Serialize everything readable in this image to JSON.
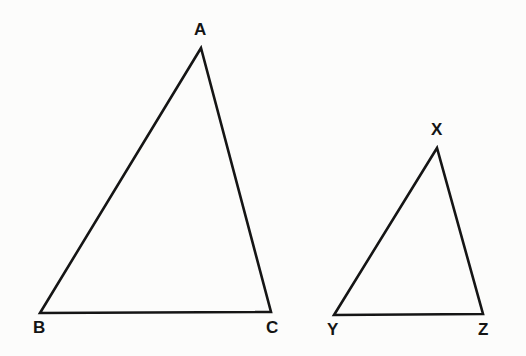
{
  "figure": {
    "kind": "geometry-diagram",
    "background_color": "#fcfcfb",
    "stroke_color": "#151515",
    "label_color": "#141414",
    "stroke_width": 2.6,
    "canvas": {
      "width": 526,
      "height": 356
    }
  },
  "shapes": [
    {
      "id": "triangle-abc",
      "name": "large-triangle",
      "type": "triangle",
      "vertices": [
        {
          "label": "A",
          "x": 201,
          "y": 48,
          "label_x": 194,
          "label_y": 21
        },
        {
          "label": "B",
          "x": 40,
          "y": 313,
          "label_x": 33,
          "label_y": 319
        },
        {
          "label": "C",
          "x": 271,
          "y": 312,
          "label_x": 266,
          "label_y": 319
        }
      ],
      "points": "201,48 40,313 271,312"
    },
    {
      "id": "triangle-xyz",
      "name": "small-triangle",
      "type": "triangle",
      "vertices": [
        {
          "label": "X",
          "x": 437,
          "y": 148,
          "label_x": 431,
          "label_y": 121
        },
        {
          "label": "Y",
          "x": 334,
          "y": 315,
          "label_x": 327,
          "label_y": 321
        },
        {
          "label": "Z",
          "x": 483,
          "y": 314,
          "label_x": 478,
          "label_y": 321
        }
      ],
      "points": "437,148 334,315 483,314"
    }
  ],
  "labels": {
    "a": "A",
    "b": "B",
    "c": "C",
    "x": "X",
    "y": "Y",
    "z": "Z"
  }
}
